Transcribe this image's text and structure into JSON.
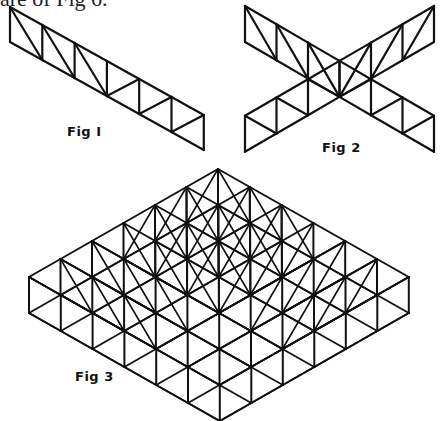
{
  "page": {
    "caption_fragment": "are of Fig 6.",
    "stroke_color": "#111111",
    "background": "#ffffff"
  },
  "figures": [
    {
      "id": "fig1",
      "label": "Fig I",
      "label_pos": [
        67,
        124
      ],
      "description": "Single strip of 6 braced cells (truss)",
      "strip": {
        "origin": [
          10,
          7
        ],
        "step": [
          32.3,
          18
        ],
        "cells": 6,
        "height": 35,
        "diag": [
          "tl-br",
          "tl-br",
          "tl-br",
          "bl-tr",
          "bl-tr",
          "bl-tr"
        ]
      }
    },
    {
      "id": "fig2",
      "label": "Fig 2",
      "label_pos": [
        322,
        140
      ],
      "description": "Two crossing strips forming an X",
      "strips": [
        {
          "origin": [
            245,
            6
          ],
          "step": [
            31.5,
            18.3
          ],
          "cells": 6,
          "height": 36,
          "diag": [
            "tl-br",
            "tl-br",
            "tl-br",
            "bl-tr",
            "bl-tr",
            "bl-tr"
          ]
        },
        {
          "origin": [
            434,
            6
          ],
          "step": [
            -31.5,
            18.3
          ],
          "cells": 6,
          "height": 36,
          "diag": [
            "tl-br",
            "tl-br",
            "tl-br",
            "bl-tr",
            "bl-tr",
            "bl-tr"
          ]
        }
      ]
    },
    {
      "id": "fig3",
      "label": "Fig 3",
      "label_pos": [
        75,
        369
      ],
      "description": "Full 6x6 braced space-frame grid",
      "grid": {
        "top": [
          218,
          169
        ],
        "u": [
          31.8,
          18
        ],
        "v": [
          -31.5,
          18
        ],
        "n": 6,
        "height": 36
      }
    }
  ]
}
